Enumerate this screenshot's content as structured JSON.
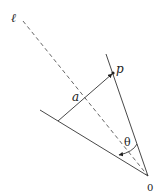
{
  "diagram": {
    "labels": {
      "line": "ℓ",
      "point": "p",
      "distance": "a",
      "angle": "θ",
      "origin": "0"
    },
    "colors": {
      "stroke": "#333333",
      "dashed": "#555555"
    }
  }
}
